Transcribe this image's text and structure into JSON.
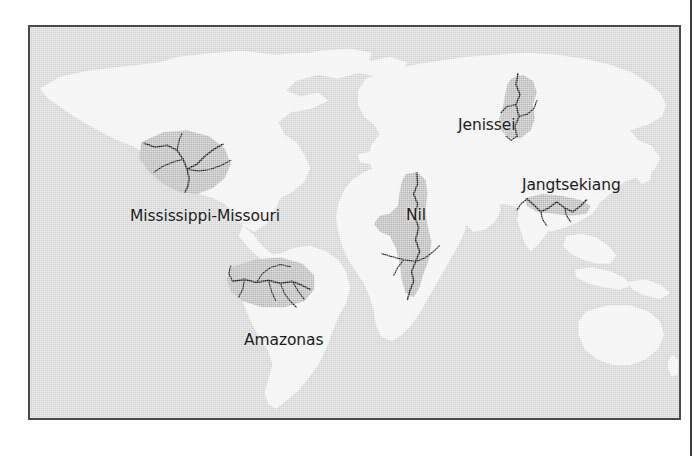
{
  "figure": {
    "kind": "world-map",
    "ocean_color": "#d2d2d2",
    "land_color": "#f2f2f2",
    "basin_color": "#b6b6b6",
    "river_color": "#1d1d1d",
    "frame_color": "#4a4a4a",
    "label_color": "#1c1c1c"
  },
  "labels": {
    "mississippi": "Mississippi-Missouri",
    "amazonas": "Amazonas",
    "nil": "Nil",
    "jenissei": "Jenissei",
    "jangtsekiang": "Jangtsekiang"
  },
  "rivers": [
    {
      "name": "Mississippi-Missouri",
      "continent": "North America"
    },
    {
      "name": "Amazonas",
      "continent": "South America"
    },
    {
      "name": "Nil",
      "continent": "Africa"
    },
    {
      "name": "Jenissei",
      "continent": "Asia"
    },
    {
      "name": "Jangtsekiang",
      "continent": "Asia"
    }
  ]
}
